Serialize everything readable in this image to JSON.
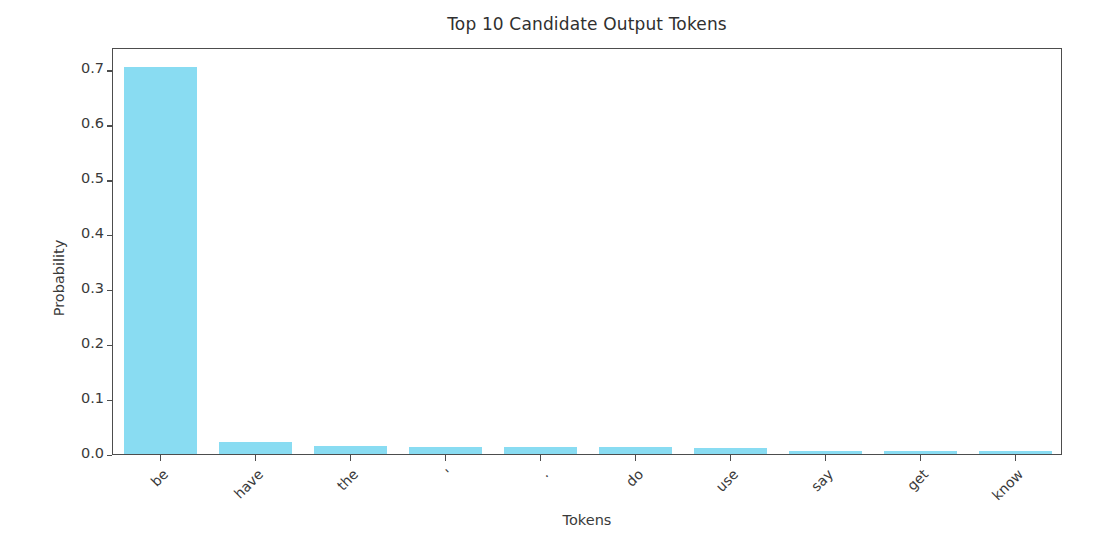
{
  "chart_data": {
    "type": "bar",
    "title": "Top 10 Candidate Output Tokens",
    "xlabel": "Tokens",
    "ylabel": "Probability",
    "categories": [
      "be",
      "have",
      "the",
      "'",
      ".",
      "do",
      "use",
      "say",
      "get",
      "know"
    ],
    "values": [
      0.705,
      0.021,
      0.015,
      0.012,
      0.012,
      0.012,
      0.011,
      0.006,
      0.006,
      0.006
    ],
    "ylim": [
      0.0,
      0.7409
    ],
    "yticks": [
      0.0,
      0.1,
      0.2,
      0.3,
      0.4,
      0.5,
      0.6,
      0.7
    ],
    "ytick_labels": [
      "0.0",
      "0.1",
      "0.2",
      "0.3",
      "0.4",
      "0.5",
      "0.6",
      "0.7"
    ],
    "grid": false,
    "legend": null,
    "bar_color": "#89dcf2",
    "axis_color": "#4d4d4d",
    "background": "#ffffff",
    "xtick_rotation": -45
  }
}
